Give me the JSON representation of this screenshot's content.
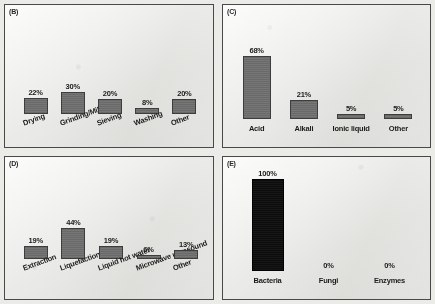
{
  "figure": {
    "panels": [
      {
        "tag": "(B)",
        "name": "pretreatment-mechanical",
        "label_style": "rotated",
        "bar_color": "#6f6f6f",
        "chart_data": {
          "type": "bar",
          "categories": [
            "Drying",
            "Grinding/Milling",
            "Sieving",
            "Washing",
            "Other"
          ],
          "values": [
            22,
            30,
            20,
            8,
            20
          ],
          "value_labels": [
            "22%",
            "30%",
            "20%",
            "8%",
            "20%"
          ],
          "title": "(B)",
          "xlabel": "",
          "ylabel": "",
          "ylim": [
            0,
            100
          ],
          "grid": false,
          "legend": "none"
        }
      },
      {
        "tag": "(C)",
        "name": "pretreatment-chemical",
        "label_style": "horizontal",
        "bar_color": "#6f6f6f",
        "chart_data": {
          "type": "bar",
          "categories": [
            "Acid",
            "Alkali",
            "Ionic liquid",
            "Other"
          ],
          "values": [
            68,
            21,
            5,
            5
          ],
          "value_labels": [
            "68%",
            "21%",
            "5%",
            "5%"
          ],
          "title": "(C)",
          "xlabel": "",
          "ylabel": "",
          "ylim": [
            0,
            100
          ],
          "grid": false,
          "legend": "none"
        }
      },
      {
        "tag": "(D)",
        "name": "conversion-process",
        "label_style": "rotated",
        "bar_color": "#6f6f6f",
        "chart_data": {
          "type": "bar",
          "categories": [
            "Extraction",
            "Liquefaction",
            "Liquid hot water",
            "Microwave ultrasound",
            "Other"
          ],
          "values": [
            19,
            44,
            19,
            6,
            13
          ],
          "value_labels": [
            "19%",
            "44%",
            "19%",
            "6%",
            "13%"
          ],
          "title": "(D)",
          "xlabel": "",
          "ylabel": "",
          "ylim": [
            0,
            100
          ],
          "grid": false,
          "legend": "none"
        }
      },
      {
        "tag": "(E)",
        "name": "biological-agent",
        "label_style": "horizontal",
        "bar_color": "#101010",
        "chart_data": {
          "type": "bar",
          "categories": [
            "Bacteria",
            "Fungi",
            "Enzymes"
          ],
          "values": [
            100,
            0,
            0
          ],
          "value_labels": [
            "100%",
            "0%",
            "0%"
          ],
          "title": "(E)",
          "xlabel": "",
          "ylabel": "",
          "ylim": [
            0,
            100
          ],
          "grid": false,
          "legend": "none"
        }
      }
    ]
  }
}
